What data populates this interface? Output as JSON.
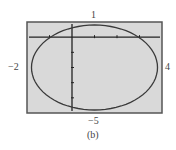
{
  "chart_data": {
    "type": "line",
    "title": "",
    "caption": "(b)",
    "xlabel": "",
    "ylabel": "",
    "xlim": [
      -2,
      4
    ],
    "ylim": [
      -5,
      1
    ],
    "grid": false,
    "window_labels": {
      "top": "1",
      "bottom": "−5",
      "left": "−2",
      "right": "4"
    },
    "x_ticks": [
      -1,
      0,
      1,
      2,
      3
    ],
    "y_ticks": [
      0,
      -1,
      -2,
      -3,
      -4
    ],
    "series": [
      {
        "name": "closed curve",
        "shape": "ellipse",
        "center": [
          1,
          -2
        ],
        "rx": 2.8,
        "ry": 2.8
      }
    ],
    "background": "#d9d9d9",
    "curve_color": "#3a3a3a",
    "axis_color": "#222222"
  }
}
